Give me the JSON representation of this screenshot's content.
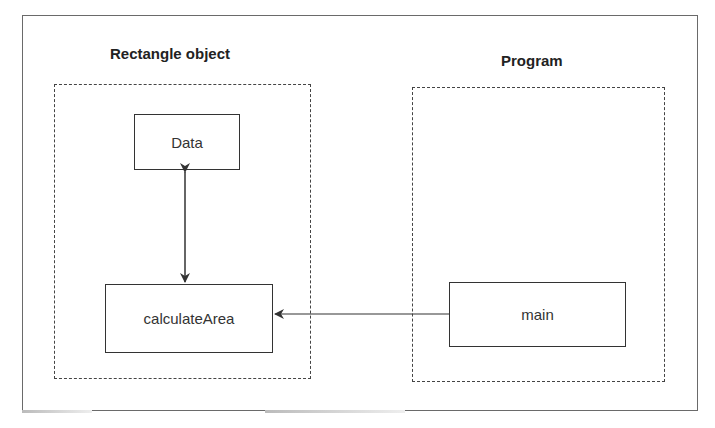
{
  "groups": {
    "rectangle_object": {
      "title": "Rectangle object",
      "nodes": {
        "data": {
          "label": "Data"
        },
        "calculate_area": {
          "label": "calculateArea"
        }
      }
    },
    "program": {
      "title": "Program",
      "nodes": {
        "main": {
          "label": "main"
        }
      }
    }
  },
  "edges": [
    {
      "from": "Data",
      "to": "calculateArea",
      "direction": "bidirectional"
    },
    {
      "from": "main",
      "to": "calculateArea",
      "direction": "one-way"
    }
  ],
  "colors": {
    "line": "#333333",
    "frame": "#6a6a6a",
    "background": "#ffffff"
  }
}
